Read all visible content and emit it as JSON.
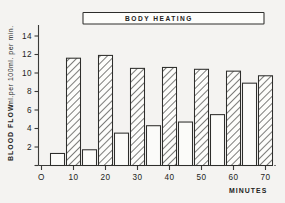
{
  "chart_data": {
    "type": "bar",
    "title": "BODY HEATING",
    "xlabel": "MINUTES",
    "ylabel": "BLOOD FLOW   ml.per 100ml. per min.",
    "ylabel_parts": {
      "main": "BLOOD  FLOW",
      "units": "ml.per 100ml. per min."
    },
    "xlim": [
      0,
      75
    ],
    "ylim": [
      0,
      15
    ],
    "grid": false,
    "legend": null,
    "y_ticks": [
      2,
      4,
      6,
      8,
      10,
      12,
      14
    ],
    "y_tick_labels": [
      "2",
      "4",
      "6",
      "8",
      "10",
      "12",
      "14"
    ],
    "x_ticks": [
      0,
      10,
      20,
      30,
      40,
      50,
      60,
      70
    ],
    "x_tick_labels": [
      "O",
      "10",
      "20",
      "30",
      "40",
      "50",
      "60",
      "70"
    ],
    "x": [
      5,
      10,
      15,
      20,
      25,
      30,
      35,
      40,
      45,
      50,
      55,
      60,
      65,
      70
    ],
    "values": [
      1.3,
      11.6,
      1.7,
      11.9,
      3.5,
      10.5,
      4.3,
      10.6,
      4.7,
      10.4,
      5.5,
      10.2,
      8.9,
      9.7
    ],
    "bar_styles": [
      "open",
      "hatched",
      "open",
      "hatched",
      "open",
      "hatched",
      "open",
      "hatched",
      "open",
      "hatched",
      "open",
      "hatched",
      "open",
      "hatched"
    ],
    "series": [
      {
        "name": "open",
        "style": "white-outline",
        "points": [
          {
            "x": 5,
            "y": 1.3
          },
          {
            "x": 15,
            "y": 1.7
          },
          {
            "x": 25,
            "y": 3.5
          },
          {
            "x": 35,
            "y": 4.3
          },
          {
            "x": 45,
            "y": 4.7
          },
          {
            "x": 55,
            "y": 5.5
          },
          {
            "x": 65,
            "y": 8.9
          }
        ]
      },
      {
        "name": "hatched",
        "style": "diagonal-hatch",
        "points": [
          {
            "x": 10,
            "y": 11.6
          },
          {
            "x": 20,
            "y": 11.9
          },
          {
            "x": 30,
            "y": 10.5
          },
          {
            "x": 40,
            "y": 10.6
          },
          {
            "x": 50,
            "y": 10.4
          },
          {
            "x": 60,
            "y": 10.2
          },
          {
            "x": 70,
            "y": 9.7
          }
        ]
      }
    ],
    "annotations": [
      {
        "name": "body-heating-bar",
        "text": "BODY HEATING",
        "x_start": 13,
        "x_end": 74,
        "y": 14.3
      }
    ],
    "colors": {
      "ink": "#2e2e2c",
      "paper": "#f4f3f1",
      "bar_fill": "#fbfbf9"
    }
  }
}
